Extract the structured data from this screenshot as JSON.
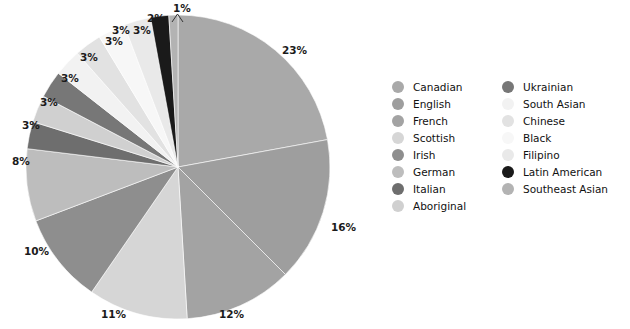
{
  "chart_data": {
    "type": "pie",
    "title": "",
    "subtitle": "",
    "xlabel": "",
    "ylabel": "",
    "legend_position": "right",
    "grid": false,
    "start_angle_deg": 0,
    "direction": "clockwise",
    "categories": [
      "Canadian",
      "English",
      "French",
      "Scottish",
      "Irish",
      "German",
      "Italian",
      "Aboriginal",
      "Ukrainian",
      "South Asian",
      "Chinese",
      "Black",
      "Filipino",
      "Latin American",
      "Southeast Asian"
    ],
    "values": [
      23,
      16,
      12,
      11,
      10,
      8,
      3,
      3,
      3,
      3,
      3,
      3,
      3,
      2,
      1
    ],
    "value_labels": [
      "23%",
      "16%",
      "12%",
      "11%",
      "10%",
      "8%",
      "3%",
      "3%",
      "3%",
      "3%",
      "3%",
      "3%",
      "3%",
      "2%",
      "1%"
    ],
    "colors": [
      "#a9a9a9",
      "#9e9e9e",
      "#a3a3a3",
      "#d6d6d6",
      "#8e8e8e",
      "#bdbdbd",
      "#6e6e6e",
      "#d0d0d0",
      "#777777",
      "#f2f2f2",
      "#e2e2e2",
      "#f7f7f7",
      "#e9e9e9",
      "#1a1a1a",
      "#b3b3b3"
    ],
    "total": 100,
    "units": "percent"
  },
  "labels": {
    "canadian_pct": "23%",
    "english_pct": "16%",
    "french_pct": "12%",
    "scottish_pct": "11%",
    "irish_pct": "10%",
    "german_pct": "8%",
    "italian_pct": "3%",
    "aboriginal_pct": "3%",
    "ukrainian_pct": "3%",
    "south_asian_pct": "3%",
    "chinese_pct": "3%",
    "black_pct": "3%",
    "filipino_pct": "3%",
    "latin_american_pct": "2%",
    "southeast_asian_pct": "1%"
  },
  "legend": {
    "left_column": [
      {
        "label": "Canadian",
        "color": "#a9a9a9"
      },
      {
        "label": "English",
        "color": "#9e9e9e"
      },
      {
        "label": "French",
        "color": "#a3a3a3"
      },
      {
        "label": "Scottish",
        "color": "#d6d6d6"
      },
      {
        "label": "Irish",
        "color": "#8e8e8e"
      },
      {
        "label": "German",
        "color": "#bdbdbd"
      },
      {
        "label": "Italian",
        "color": "#6e6e6e"
      },
      {
        "label": "Aboriginal",
        "color": "#d0d0d0"
      }
    ],
    "right_column": [
      {
        "label": "Ukrainian",
        "color": "#777777"
      },
      {
        "label": "South Asian",
        "color": "#f2f2f2"
      },
      {
        "label": "Chinese",
        "color": "#e2e2e2"
      },
      {
        "label": "Black",
        "color": "#f7f7f7"
      },
      {
        "label": "Filipino",
        "color": "#e9e9e9"
      },
      {
        "label": "Latin American",
        "color": "#1a1a1a"
      },
      {
        "label": "Southeast Asian",
        "color": "#b3b3b3"
      }
    ]
  }
}
